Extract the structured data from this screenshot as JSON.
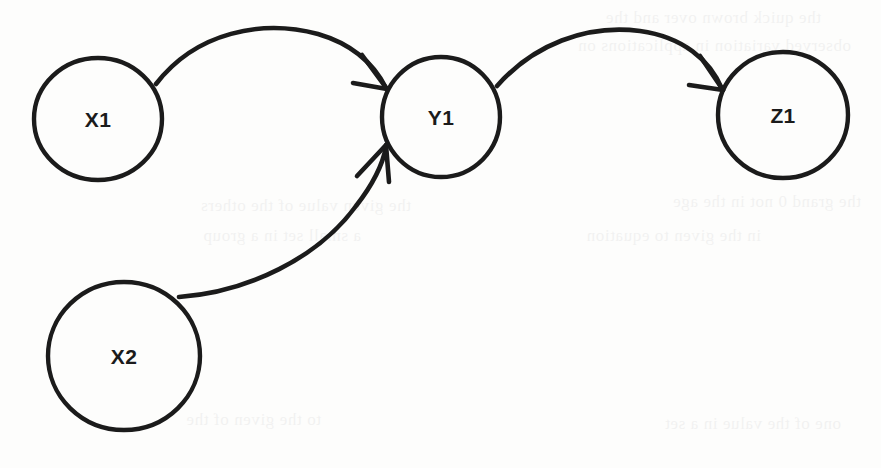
{
  "diagram": {
    "type": "directed-graph",
    "title": "",
    "background_color": "#fdfdfc",
    "ink_color": "#1b1b1b",
    "nodes": [
      {
        "id": "X1",
        "label": "X1",
        "cx": 98,
        "cy": 119,
        "rx": 64,
        "ry": 61,
        "stroke_width": 4.4
      },
      {
        "id": "Y1",
        "label": "Y1",
        "cx": 441,
        "cy": 117,
        "rx": 59,
        "ry": 60,
        "stroke_width": 4.4
      },
      {
        "id": "Z1",
        "label": "Z1",
        "cx": 783,
        "cy": 115,
        "rx": 65,
        "ry": 63,
        "stroke_width": 4.4
      },
      {
        "id": "X2",
        "label": "X2",
        "cx": 124,
        "cy": 356,
        "rx": 76,
        "ry": 74,
        "stroke_width": 4.4
      }
    ],
    "edges": [
      {
        "id": "x1-to-y1",
        "from": "X1",
        "to": "Y1",
        "label": "",
        "stroke_width": 4.6,
        "path": "M 156 84 C 196 32, 262 19, 318 34 C 352 44, 374 64, 386 88",
        "arrow": {
          "tip_x": 387,
          "tip_y": 89,
          "barbs": [
            {
              "x1": 387,
              "y1": 89,
              "x2": 353,
              "y2": 83
            },
            {
              "x1": 387,
              "y1": 89,
              "x2": 362,
              "y2": 55
            }
          ],
          "stroke_width": 4.6
        }
      },
      {
        "id": "y1-to-z1",
        "from": "Y1",
        "to": "Z1",
        "label": "",
        "stroke_width": 4.6,
        "path": "M 497 86 C 533 45, 586 24, 640 31 C 683 37, 710 60, 722 89",
        "arrow": {
          "tip_x": 723,
          "tip_y": 90,
          "barbs": [
            {
              "x1": 723,
              "y1": 90,
              "x2": 689,
              "y2": 85
            },
            {
              "x1": 723,
              "y1": 90,
              "x2": 700,
              "y2": 56
            }
          ],
          "stroke_width": 4.6
        }
      },
      {
        "id": "x2-to-y1",
        "from": "X2",
        "to": "Y1",
        "label": "",
        "stroke_width": 4.6,
        "path": "M 179 297 C 248 292, 318 258, 356 206 C 374 183, 383 163, 386 147",
        "arrow": {
          "tip_x": 386,
          "tip_y": 145,
          "barbs": [
            {
              "x1": 386,
              "y1": 145,
              "x2": 357,
              "y2": 176
            },
            {
              "x1": 386,
              "y1": 145,
              "x2": 389,
              "y2": 182
            }
          ],
          "stroke_width": 4.6
        }
      }
    ],
    "bleed_through_text": [
      {
        "text": "the quick brown over and the",
        "x": 60,
        "y": 8
      },
      {
        "text": "observed variation in applications on",
        "x": 30,
        "y": 36
      },
      {
        "text": "the grand 0 not in the age",
        "x": 20,
        "y": 192
      },
      {
        "text": "in the given to equation",
        "x": 120,
        "y": 226
      },
      {
        "text": "the given value of the others",
        "x": 470,
        "y": 196
      },
      {
        "text": "a small set in a group",
        "x": 520,
        "y": 226
      },
      {
        "text": "one of the value in a set",
        "x": 40,
        "y": 414
      },
      {
        "text": "to the given of the",
        "x": 560,
        "y": 410
      }
    ]
  }
}
